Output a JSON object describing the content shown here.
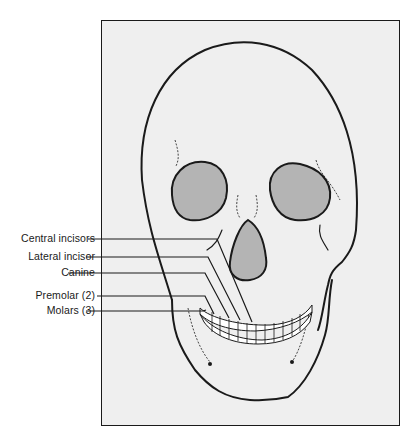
{
  "figure": {
    "colors": {
      "background": "#efefef",
      "line": "#1a1a1a",
      "cavity_fill": "#b4b4b4"
    }
  },
  "labels": [
    {
      "id": "central-incisors",
      "text": "Central incisors",
      "y": 239
    },
    {
      "id": "lateral-incisor",
      "text": "Lateral incisor",
      "y": 257
    },
    {
      "id": "canine",
      "text": "Canine",
      "y": 273
    },
    {
      "id": "premolar",
      "text": "Premolar (2)",
      "y": 296
    },
    {
      "id": "molars",
      "text": "Molars (3)",
      "y": 311
    }
  ]
}
